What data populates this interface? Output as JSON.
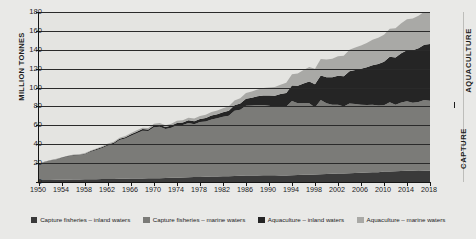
{
  "chart_data": {
    "type": "area",
    "title": "",
    "xlabel": "",
    "ylabel": "MILLION TONNES",
    "ylim": [
      0,
      180
    ],
    "xlim": [
      1950,
      2018
    ],
    "grid": true,
    "stacked": true,
    "legend_position": "bottom",
    "y_ticks": [
      0,
      20,
      40,
      60,
      80,
      100,
      120,
      140,
      160,
      180
    ],
    "x_ticks": [
      1950,
      1954,
      1958,
      1962,
      1966,
      1970,
      1974,
      1978,
      1982,
      1986,
      1990,
      1994,
      1998,
      2002,
      2006,
      2010,
      2014,
      2018
    ],
    "x": [
      1950,
      1951,
      1952,
      1953,
      1954,
      1955,
      1956,
      1957,
      1958,
      1959,
      1960,
      1961,
      1962,
      1963,
      1964,
      1965,
      1966,
      1967,
      1968,
      1969,
      1970,
      1971,
      1972,
      1973,
      1974,
      1975,
      1976,
      1977,
      1978,
      1979,
      1980,
      1981,
      1982,
      1983,
      1984,
      1985,
      1986,
      1987,
      1988,
      1989,
      1990,
      1991,
      1992,
      1993,
      1994,
      1995,
      1996,
      1997,
      1998,
      1999,
      2000,
      2001,
      2002,
      2003,
      2004,
      2005,
      2006,
      2007,
      2008,
      2009,
      2010,
      2011,
      2012,
      2013,
      2014,
      2015,
      2016,
      2017,
      2018
    ],
    "series": [
      {
        "name": "Capture fisheries – inland waters",
        "color": "#3a3a3a",
        "values": [
          2.0,
          2.1,
          2.2,
          2.3,
          2.4,
          2.5,
          2.6,
          2.7,
          2.8,
          2.9,
          3.0,
          3.1,
          3.2,
          3.3,
          3.4,
          3.5,
          3.6,
          3.7,
          3.8,
          3.9,
          4.0,
          4.1,
          4.2,
          4.4,
          4.6,
          4.8,
          5.0,
          5.2,
          5.4,
          5.6,
          5.8,
          5.9,
          6.0,
          6.2,
          6.4,
          6.6,
          6.8,
          6.9,
          7.0,
          7.1,
          7.2,
          7.2,
          7.0,
          7.0,
          7.2,
          7.4,
          7.6,
          7.8,
          8.0,
          8.2,
          8.5,
          8.8,
          8.9,
          9.0,
          9.2,
          9.5,
          9.8,
          10.0,
          10.2,
          10.4,
          11.2,
          11.0,
          11.4,
          11.7,
          11.9,
          12.0,
          11.7,
          11.9,
          12.0
        ]
      },
      {
        "name": "Capture fisheries – marine waters",
        "color": "#7b7b78",
        "values": [
          17.0,
          19.0,
          20.5,
          21.5,
          23.0,
          24.5,
          25.5,
          25.5,
          26.5,
          29.0,
          31.0,
          33.0,
          35.5,
          37.0,
          41.0,
          42.5,
          45.5,
          48.0,
          50.5,
          50.0,
          54.0,
          54.5,
          52.0,
          53.0,
          55.5,
          55.5,
          57.5,
          56.0,
          58.0,
          58.5,
          60.5,
          61.5,
          63.0,
          64.0,
          69.0,
          70.0,
          74.0,
          74.0,
          74.5,
          74.5,
          73.5,
          72.5,
          73.5,
          73.0,
          78.5,
          76.0,
          76.0,
          75.5,
          71.0,
          78.5,
          75.0,
          73.0,
          73.0,
          71.0,
          74.0,
          73.0,
          72.0,
          71.5,
          71.5,
          70.5,
          70.0,
          73.5,
          70.5,
          72.5,
          73.5,
          72.0,
          73.0,
          75.0,
          74.0
        ]
      },
      {
        "name": "Aquaculture – inland waters",
        "color": "#252525",
        "values": [
          0.3,
          0.3,
          0.4,
          0.4,
          0.5,
          0.5,
          0.6,
          0.6,
          0.7,
          0.8,
          0.9,
          1.0,
          1.1,
          1.2,
          1.3,
          1.4,
          1.5,
          1.6,
          1.7,
          1.8,
          1.9,
          2.0,
          2.1,
          2.3,
          2.5,
          2.7,
          2.9,
          3.1,
          3.4,
          3.7,
          4.0,
          4.4,
          4.8,
          5.3,
          5.9,
          6.6,
          7.4,
          8.3,
          9.2,
          10.0,
          10.8,
          11.6,
          12.6,
          14.3,
          16.5,
          18.6,
          20.8,
          23.0,
          24.5,
          26.0,
          27.5,
          29.0,
          30.5,
          32.0,
          34.0,
          36.0,
          38.0,
          40.0,
          42.0,
          44.0,
          46.0,
          48.0,
          50.0,
          52.0,
          54.0,
          55.5,
          57.0,
          58.5,
          60.0
        ]
      },
      {
        "name": "Aquaculture – marine waters",
        "color": "#a9a9a6",
        "values": [
          0.2,
          0.2,
          0.3,
          0.3,
          0.4,
          0.4,
          0.5,
          0.5,
          0.6,
          0.6,
          0.7,
          0.8,
          0.9,
          1.0,
          1.1,
          1.2,
          1.3,
          1.4,
          1.5,
          1.6,
          1.7,
          1.8,
          1.9,
          2.1,
          2.3,
          2.5,
          2.7,
          2.9,
          3.1,
          3.4,
          3.7,
          4.0,
          4.3,
          4.7,
          5.1,
          5.6,
          6.1,
          6.7,
          7.3,
          7.9,
          8.5,
          9.2,
          10.0,
          10.9,
          11.9,
          13.0,
          14.2,
          15.4,
          16.5,
          17.6,
          18.7,
          19.8,
          20.8,
          21.8,
          22.8,
          23.8,
          24.8,
          25.8,
          26.8,
          27.8,
          28.8,
          29.8,
          30.8,
          31.8,
          32.8,
          33.5,
          34.2,
          34.9,
          35.5
        ]
      }
    ]
  },
  "axis": {
    "y_title": "MILLION TONNES"
  },
  "side_labels": {
    "aquaculture": "AQUACULTURE",
    "capture": "CAPTURE"
  }
}
